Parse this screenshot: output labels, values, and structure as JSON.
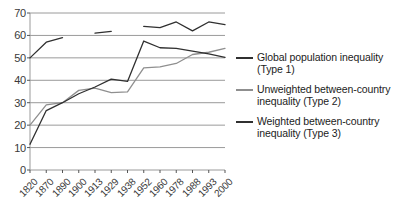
{
  "chart_data": {
    "type": "line",
    "title": "",
    "subtitle": "",
    "xlabel": "",
    "ylabel": "",
    "ylim": [
      0,
      70
    ],
    "ytick_step": 10,
    "grid": true,
    "legend_position": "right",
    "categories": [
      "1820",
      "1870",
      "1890",
      "1900",
      "1913",
      "1929",
      "1938",
      "1952",
      "1960",
      "1978",
      "1988",
      "1993",
      "2000"
    ],
    "yticks": [
      "0",
      "10",
      "20",
      "30",
      "40",
      "50",
      "60",
      "70"
    ],
    "series": [
      {
        "name": "Global population inequality (Type 1)",
        "short_name": "Type 1",
        "color": "#303030",
        "segments": [
          {
            "x": [
              "1820",
              "1870",
              "1890"
            ],
            "values": [
              50.0,
              57.0,
              59.0
            ]
          },
          {
            "x": [
              "1913",
              "1929"
            ],
            "values": [
              61.0,
              61.8
            ]
          },
          {
            "x": [
              "1952",
              "1960",
              "1978",
              "1988",
              "1993",
              "2000"
            ],
            "values": [
              64.0,
              63.5,
              66.0,
              62.0,
              66.0,
              64.8
            ]
          }
        ]
      },
      {
        "name": "Unweighted between-country inequality (Type 2)",
        "short_name": "Type 2",
        "color": "#8f8f8f",
        "x": [
          "1820",
          "1870",
          "1890",
          "1900",
          "1913",
          "1929",
          "1938",
          "1952",
          "1960",
          "1978",
          "1988",
          "1993",
          "2000"
        ],
        "values": [
          20.0,
          29.0,
          30.0,
          35.5,
          36.5,
          34.5,
          34.8,
          45.5,
          46.0,
          47.5,
          51.5,
          52.5,
          54.2
        ]
      },
      {
        "name": "Weighted between-country inequality (Type 3)",
        "short_name": "Type 3",
        "color": "#303030",
        "x": [
          "1820",
          "1870",
          "1890",
          "1900",
          "1913",
          "1929",
          "1938",
          "1952",
          "1960",
          "1978",
          "1988",
          "1993",
          "2000"
        ],
        "values": [
          11.5,
          26.5,
          30.0,
          34.0,
          37.0,
          40.5,
          39.5,
          57.5,
          54.5,
          54.2,
          53.0,
          51.8,
          50.2
        ]
      }
    ]
  },
  "legend": {
    "items": [
      {
        "label": "Global population inequality (Type 1)",
        "color": "#303030"
      },
      {
        "label": "Unweighted between-country inequality (Type 2)",
        "color": "#8f8f8f"
      },
      {
        "label": "Weighted between-country inequality (Type 3)",
        "color": "#303030"
      }
    ]
  }
}
